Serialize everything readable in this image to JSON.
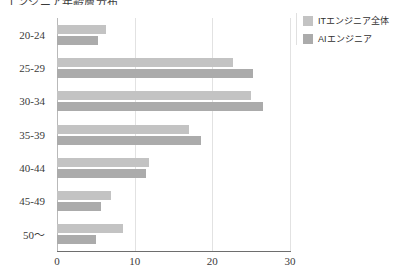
{
  "chart_data": {
    "type": "bar",
    "orientation": "horizontal",
    "title": "",
    "xlabel": "",
    "ylabel": "",
    "categories": [
      "20-24",
      "25-29",
      "30-34",
      "35-39",
      "40-44",
      "45-49",
      "50～"
    ],
    "series": [
      {
        "name": "ITエンジニア全体",
        "color": "#c3c3c3",
        "values": [
          6.3,
          22.7,
          25.0,
          17.0,
          11.8,
          7.0,
          8.5
        ]
      },
      {
        "name": "AIエンジニア",
        "color": "#ababab",
        "values": [
          5.3,
          25.3,
          26.5,
          18.5,
          11.5,
          5.7,
          5.0
        ]
      }
    ],
    "xlim": [
      0,
      30
    ],
    "xticks": [
      "0",
      "10",
      "20",
      "30"
    ],
    "xtick_values": [
      0,
      10,
      20,
      30
    ],
    "grid": true,
    "grid_axis": "x",
    "legend_position": "right"
  },
  "legend": {
    "items": [
      {
        "label": "ITエンジニア全体",
        "color": "#c3c3c3"
      },
      {
        "label": "AIエンジニア",
        "color": "#ababab"
      }
    ]
  },
  "header": {
    "clipped_title": "エンジニア年齢層分布"
  }
}
